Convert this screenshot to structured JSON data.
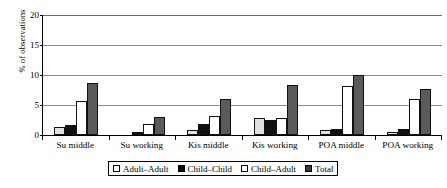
{
  "chart_data": {
    "type": "bar",
    "title": "",
    "xlabel": "",
    "ylabel": "% of observations",
    "ylim": [
      0,
      20
    ],
    "yticks": [
      0,
      5,
      10,
      15,
      20
    ],
    "ytick_labels": [
      "0",
      "5",
      "10",
      "15",
      "20"
    ],
    "grid": "horizontal",
    "legend_position": "bottom",
    "categories": [
      "Su middle",
      "Su working",
      "Kis middle",
      "Kis working",
      "POA middle",
      "POA working"
    ],
    "series": [
      {
        "name": "Adult–Adult",
        "color": "#e0e0e0",
        "values": [
          1.4,
          0.0,
          0.9,
          2.9,
          0.8,
          0.5
        ]
      },
      {
        "name": "Child–Child",
        "color": "#101010",
        "values": [
          1.6,
          0.5,
          1.9,
          2.5,
          1.0,
          1.0
        ]
      },
      {
        "name": "Child–Adult",
        "color": "#ffffff",
        "values": [
          5.6,
          1.9,
          3.2,
          2.8,
          8.2,
          6.0
        ]
      },
      {
        "name": "Total",
        "color": "#5a5a5a",
        "values": [
          8.6,
          3.0,
          6.0,
          8.3,
          10.0,
          7.6
        ]
      }
    ]
  },
  "legend": {
    "items": [
      {
        "label": "Adult–Adult",
        "swatch": "sw-adult-adult"
      },
      {
        "label": "Child–Child",
        "swatch": "sw-child-child"
      },
      {
        "label": "Child–Adult",
        "swatch": "sw-child-adult"
      },
      {
        "label": "Total",
        "swatch": "sw-total"
      }
    ]
  }
}
